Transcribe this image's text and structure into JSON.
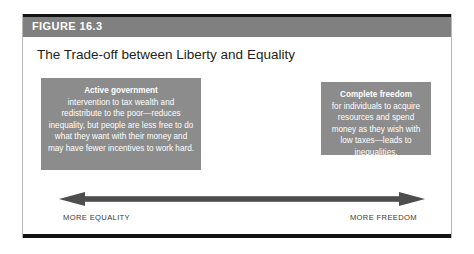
{
  "figure": {
    "header_label": "FIGURE 16.3",
    "title": "The Trade-off between Liberty and Equality",
    "colors": {
      "header_band": "#808080",
      "box_fill": "#8c8c8c",
      "rule": "#141414",
      "frame_border": "#b9b9b9",
      "box_text": "#ffffff",
      "title_text": "#231f20",
      "caption_text": "#3a3a3a",
      "arrow": "#4d4d4d"
    }
  },
  "boxes": {
    "left": {
      "heading": "Active government",
      "body": "intervention to tax wealth and redistribute to the poor—reduces inequality, but people are less free to do what they want with their money and may have fewer incentives to work hard."
    },
    "right": {
      "heading": "Complete freedom",
      "body": "for individuals to acquire resources and spend money as they wish with low taxes—leads to inequalities."
    }
  },
  "axis": {
    "left_caption": "MORE EQUALITY",
    "right_caption": "MORE FREEDOM",
    "arrow_icon": "double-headed-horizontal-arrow-icon"
  }
}
